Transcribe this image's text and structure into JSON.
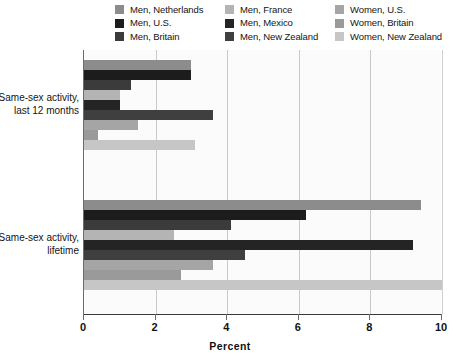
{
  "chart_data": {
    "type": "bar",
    "orientation": "horizontal",
    "title": "",
    "xlabel": "Percent",
    "ylabel": "",
    "xlim": [
      0,
      10
    ],
    "xticks": [
      0,
      2,
      4,
      6,
      8,
      10
    ],
    "xticklabels": [
      "0",
      "2",
      "4",
      "6",
      "8",
      "10"
    ],
    "grid": "vertical",
    "legend_position": "top",
    "categories": [
      "Same-sex activity, last 12 months",
      "Same-sex activity, lifetime"
    ],
    "series": [
      {
        "name": "Men, Netherlands",
        "color": "#8c8c8c",
        "values": [
          3.0,
          9.4
        ]
      },
      {
        "name": "Men, U.S.",
        "color": "#1c1c1c",
        "values": [
          3.0,
          6.2
        ]
      },
      {
        "name": "Men, Britain",
        "color": "#3b3b3b",
        "values": [
          1.3,
          4.1
        ]
      },
      {
        "name": "Men, France",
        "color": "#b4b4b4",
        "values": [
          1.0,
          2.5
        ]
      },
      {
        "name": "Men, Mexico",
        "color": "#242424",
        "values": [
          1.0,
          9.2
        ]
      },
      {
        "name": "Men, New Zealand",
        "color": "#3f3f3f",
        "values": [
          3.6,
          4.5
        ]
      },
      {
        "name": "Women, U.S.",
        "color": "#a5a5a5",
        "values": [
          1.5,
          3.6
        ]
      },
      {
        "name": "Women, Britain",
        "color": "#9a9a9a",
        "values": [
          0.4,
          2.7
        ]
      },
      {
        "name": "Women, New Zealand",
        "color": "#c6c6c6",
        "values": [
          3.1,
          10.0
        ]
      }
    ]
  },
  "legend": {
    "columns": [
      [
        {
          "label": "Men, Netherlands",
          "swatch": "#8c8c8c"
        },
        {
          "label": "Men, U.S.",
          "swatch": "#1c1c1c"
        },
        {
          "label": "Men, Britain",
          "swatch": "#3b3b3b"
        }
      ],
      [
        {
          "label": "Men, France",
          "swatch": "#b4b4b4"
        },
        {
          "label": "Men, Mexico",
          "swatch": "#242424"
        },
        {
          "label": "Men, New Zealand",
          "swatch": "#3f3f3f"
        }
      ],
      [
        {
          "label": "Women, U.S.",
          "swatch": "#a5a5a5"
        },
        {
          "label": "Women, Britain",
          "swatch": "#9a9a9a"
        },
        {
          "label": "Women, New Zealand",
          "swatch": "#c6c6c6"
        }
      ]
    ]
  },
  "axis": {
    "x_title": "Percent",
    "tick_labels": [
      "0",
      "2",
      "4",
      "6",
      "8",
      "10"
    ]
  },
  "group_labels": [
    {
      "line1": "Same-sex activity,",
      "line2": "last 12 months"
    },
    {
      "line1": "Same-sex activity,",
      "line2": "lifetime"
    }
  ]
}
